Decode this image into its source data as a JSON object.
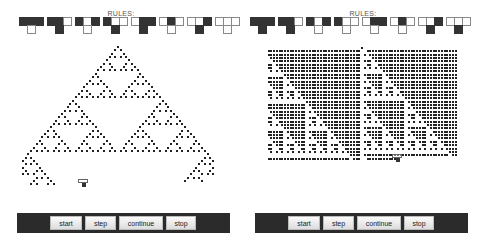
{
  "panels": [
    {
      "id": "left",
      "rules_title": "RULES:",
      "rule_number": 90,
      "rules": [
        {
          "pattern": [
            1,
            1,
            1
          ],
          "output": 0
        },
        {
          "pattern": [
            1,
            1,
            0
          ],
          "output": 1
        },
        {
          "pattern": [
            1,
            0,
            1
          ],
          "output": 0
        },
        {
          "pattern": [
            1,
            0,
            0
          ],
          "output": 1
        },
        {
          "pattern": [
            0,
            1,
            1
          ],
          "output": 1
        },
        {
          "pattern": [
            0,
            1,
            0
          ],
          "output": 0
        },
        {
          "pattern": [
            0,
            0,
            1
          ],
          "output": 1
        },
        {
          "pattern": [
            0,
            0,
            0
          ],
          "output": 0
        }
      ],
      "buttons": {
        "start": "start",
        "step": "step",
        "continue": "continue",
        "stop": "stop"
      }
    },
    {
      "id": "right",
      "rules_title": "RULES:",
      "rule_number": 195,
      "rules": [
        {
          "pattern": [
            1,
            1,
            1
          ],
          "output": 1
        },
        {
          "pattern": [
            1,
            1,
            0
          ],
          "output": 1
        },
        {
          "pattern": [
            1,
            0,
            1
          ],
          "output": 0
        },
        {
          "pattern": [
            1,
            0,
            0
          ],
          "output": 0
        },
        {
          "pattern": [
            0,
            1,
            1
          ],
          "output": 0
        },
        {
          "pattern": [
            0,
            1,
            0
          ],
          "output": 0
        },
        {
          "pattern": [
            0,
            0,
            1
          ],
          "output": 1
        },
        {
          "pattern": [
            0,
            0,
            0
          ],
          "output": 1
        }
      ],
      "buttons": {
        "start": "start",
        "step": "step",
        "continue": "continue",
        "stop": "stop"
      }
    }
  ],
  "colors": {
    "cell_on": "#222222",
    "rule_on": "#333333",
    "rule_border": "#888888",
    "toolbar_bg": "#2b2b2b"
  }
}
